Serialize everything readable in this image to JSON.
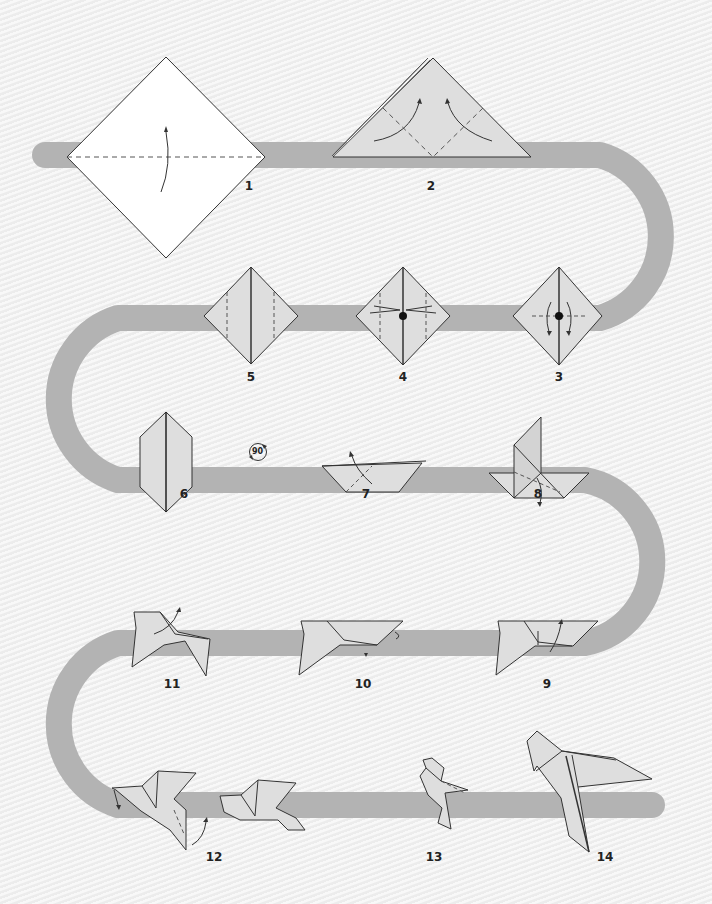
{
  "diagram": {
    "colors": {
      "background": "#f0f0f0",
      "path": "#b3b3b3",
      "paper_first": "#ffffff",
      "paper": "#dedede",
      "line": "#333333"
    },
    "rotate_symbol": {
      "label": "90",
      "icon": "rotate-90-icon"
    },
    "steps": [
      {
        "number": "1",
        "description": "White square diamond, fold bottom up along horizontal diagonal (valley fold)"
      },
      {
        "number": "2",
        "description": "Triangle, fold both side corners up to top"
      },
      {
        "number": "3",
        "description": "Diamond with center point, fold edges out"
      },
      {
        "number": "4",
        "description": "Diamond with center point, arrows pointing outward"
      },
      {
        "number": "5",
        "description": "Diamond with vertical dashed crease lines"
      },
      {
        "number": "6",
        "description": "Narrow kite shape"
      },
      {
        "number": "7",
        "description": "Trapezoid boat shape, fold up"
      },
      {
        "number": "8",
        "description": "Shape with vertical flap, fold down"
      },
      {
        "number": "9",
        "description": "Bird form, inside fold"
      },
      {
        "number": "10",
        "description": "Bird form with tail fold"
      },
      {
        "number": "11",
        "description": "Bird form, fold wing up"
      },
      {
        "number": "12",
        "description": "Bird with wings, fold head and wing"
      },
      {
        "number": "13",
        "description": "Standing bird"
      },
      {
        "number": "14",
        "description": "Finished origami bird"
      }
    ]
  }
}
